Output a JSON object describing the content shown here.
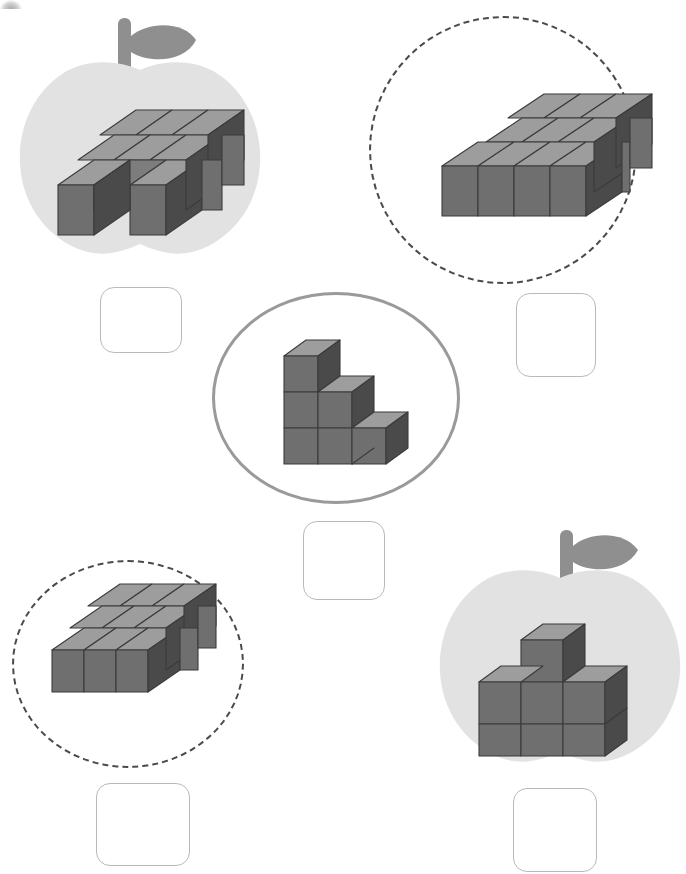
{
  "page": {
    "background": "#ffffff",
    "width": 686,
    "height": 874
  },
  "colors": {
    "cube_top": "#9d9d9d",
    "cube_front": "#6f6f6f",
    "cube_side": "#4a4a4a",
    "cube_edge": "#3b3b3b",
    "apple_fill": "#e2e2e2",
    "apple_stem": "#8f8f8f",
    "circle_dashed": "#4a4a4a",
    "circle_solid": "#9a9a9a",
    "answer_box_border": "#b9b9b9",
    "answer_box_fill": "#ffffff"
  },
  "center": {
    "container_name": "center-solid-circle",
    "shape": {
      "name": "staircase-3-2-1",
      "description": "Staircase of cubes, three columns of heights 3, 2 and 1",
      "columns": [
        3,
        2,
        1
      ],
      "cube_count": 6
    },
    "answer_box": {
      "value": "",
      "placeholder": ""
    }
  },
  "options": [
    {
      "id": "option-top-left",
      "frame": "apple",
      "position": "top-left",
      "shape": {
        "name": "slab-3x3-with-front-notch",
        "description": "Flat one-layer 3 by 3 slab with the middle cube of the front row removed",
        "rows": [
          3,
          3,
          2
        ],
        "cube_count": 8
      },
      "answer_box": {
        "value": "",
        "placeholder": ""
      }
    },
    {
      "id": "option-top-right",
      "frame": "dashed-circle",
      "position": "top-right",
      "shape": {
        "name": "slab-l-shaped-4x3",
        "description": "Flat one-layer slab, back rows three wide and front row four wide",
        "rows": [
          3,
          3,
          4
        ],
        "cube_count": 10
      },
      "answer_box": {
        "value": "",
        "placeholder": ""
      }
    },
    {
      "id": "option-bottom-left",
      "frame": "dashed-circle",
      "position": "bottom-left",
      "shape": {
        "name": "slab-3x3-flat",
        "description": "Flat one-layer 3 by 3 slab",
        "rows": [
          3,
          3,
          3
        ],
        "cube_count": 9
      },
      "answer_box": {
        "value": "",
        "placeholder": ""
      }
    },
    {
      "id": "option-bottom-right",
      "frame": "apple",
      "position": "bottom-right",
      "shape": {
        "name": "wall-3x2-with-top-middle-cube",
        "description": "Wall three cubes wide and two cubes tall with one extra cube on top of the middle column",
        "columns": [
          2,
          3,
          2
        ],
        "cube_count": 7
      },
      "answer_box": {
        "value": "",
        "placeholder": ""
      }
    }
  ]
}
